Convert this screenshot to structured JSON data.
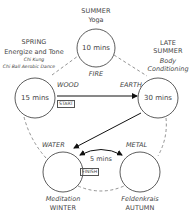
{
  "nodes": {
    "fire": {
      "element": "FIRE",
      "season": "SUMMER",
      "activity": "Yoga",
      "duration": "10 mins"
    },
    "wood": {
      "element": "WOOD",
      "season": "SPRING",
      "activity": "Energize and Tone",
      "sub_activities": [
        "Chi Kung",
        "Chi Ball Aerobic Dance"
      ],
      "duration": "15 mins",
      "badge": "START"
    },
    "earth": {
      "element": "EARTH",
      "season_line1": "LATE",
      "season_line2": "SUMMER",
      "activity_line1": "Body",
      "activity_line2": "Conditioning",
      "duration": "30 mins"
    },
    "water": {
      "element": "WATER",
      "season": "WINTER",
      "activity": "Meditation",
      "badge": "FINISH"
    },
    "metal": {
      "element": "METAL",
      "season": "AUTUMN",
      "activity": "Feldenkrais"
    }
  },
  "connections": {
    "water_metal_label": "5 mins"
  },
  "colors": {
    "line": "#222222",
    "dash": "#777777",
    "text": "#444444"
  }
}
